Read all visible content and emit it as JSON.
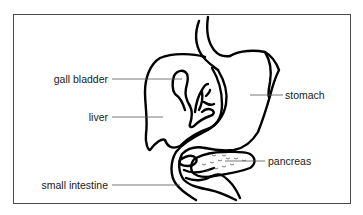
{
  "diagram": {
    "type": "anatomical-labeled-diagram",
    "labels": {
      "gall_bladder": "gall bladder",
      "liver": "liver",
      "small_intestine": "small intestine",
      "stomach": "stomach",
      "pancreas": "pancreas"
    },
    "label_sides": {
      "left": [
        "gall bladder",
        "liver",
        "small intestine"
      ],
      "right": [
        "stomach",
        "pancreas"
      ]
    },
    "colors": {
      "outline": "#000000",
      "leader_line": "#555555",
      "frame": "#4a4a4a",
      "background": "#ffffff"
    }
  }
}
